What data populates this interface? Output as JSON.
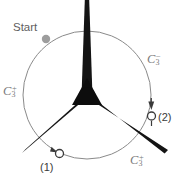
{
  "figure": {
    "title_label": "Start",
    "colors": {
      "rotor": "#111111",
      "circle": "#8a8a8a",
      "start_dot": "#9a9a9a",
      "marker_outline": "#3a3a3a",
      "operation_label": "#7a7a7a",
      "index_label": "#3a3a3a",
      "background": "#ffffff"
    },
    "geometry": {
      "center_x": 87,
      "center_y": 95,
      "circle_radius": 64,
      "blade_angles_deg": [
        90,
        210,
        330
      ],
      "blade_length": 95
    }
  },
  "labels": {
    "start": "Start",
    "c3_left": {
      "symbol": "C",
      "sub": "3",
      "sup": "+"
    },
    "c3_right": {
      "symbol": "C",
      "sub": "3",
      "sup": "−"
    },
    "c3_bottom": {
      "symbol": "C",
      "sub": "3",
      "sup": "+"
    },
    "position_1": "(1)",
    "position_2": "(2)"
  },
  "markers": [
    {
      "name": "start-dot",
      "label": "Start",
      "style": "filled-gray-circle",
      "x": 46,
      "y": 39
    },
    {
      "name": "position-1",
      "label": "(1)",
      "style": "open-circle",
      "x": 57,
      "y": 153
    },
    {
      "name": "position-2",
      "label": "(2)",
      "style": "open-circle",
      "x": 151,
      "y": 116
    }
  ],
  "arrows": [
    {
      "name": "arrow-to-position-1",
      "target": "(1)",
      "direction": "clockwise-along-circle"
    },
    {
      "name": "arrow-to-position-2",
      "target": "(2)",
      "direction": "counterclockwise-along-circle"
    }
  ]
}
